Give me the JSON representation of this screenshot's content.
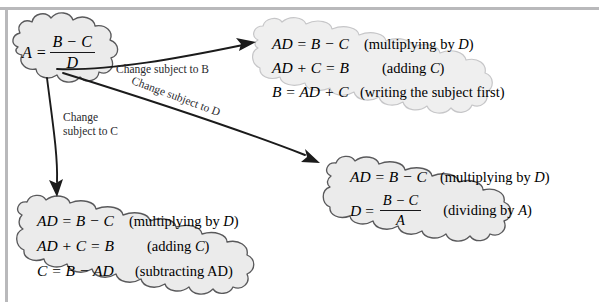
{
  "diagram": {
    "colors": {
      "cloud_fill": "#ebebeb",
      "cloud_stroke": "#59595b",
      "pale_cloud_fill": "#efefef",
      "pale_cloud_stroke": "#c6c6c8",
      "arrow": "#1b1b1b",
      "page_rule": "#b9b9bb",
      "text": "#17171a"
    },
    "source": {
      "lhs": "A",
      "equals": "=",
      "numerator": "B − C",
      "denominator": "D",
      "full": "A = (B − C) / D"
    },
    "arrows": [
      {
        "id": "to-b",
        "label": "Change subject to B",
        "rotated": false,
        "target": "result-b"
      },
      {
        "id": "to-d",
        "label": "Change subject to D",
        "rotated": true,
        "target": "result-d"
      },
      {
        "id": "to-c",
        "label_line1": "Change",
        "label_line2": "subject to C",
        "rotated": false,
        "target": "result-c"
      }
    ],
    "results": [
      {
        "id": "result-b",
        "style": "pale",
        "rows": [
          {
            "lhs": "AD = B − C",
            "rhs_prefix": "(multiplying by ",
            "rhs_italic": "D",
            "rhs_suffix": ")"
          },
          {
            "lhs": "AD + C = B",
            "rhs_prefix": "(adding ",
            "rhs_italic": "C",
            "rhs_suffix": ")"
          },
          {
            "lhs": "B = AD + C",
            "rhs_prefix": "(writing the subject first)",
            "rhs_italic": "",
            "rhs_suffix": ""
          }
        ]
      },
      {
        "id": "result-d",
        "style": "normal",
        "rows": [
          {
            "lhs": "AD = B − C",
            "rhs_prefix": "(multiplying by ",
            "rhs_italic": "D",
            "rhs_suffix": ")"
          },
          {
            "lhs_fraction": {
              "left": "D",
              "equals": "=",
              "numerator": "B − C",
              "denominator": "A"
            },
            "rhs_prefix": "(dividing by ",
            "rhs_italic": "A",
            "rhs_suffix": ")"
          }
        ]
      },
      {
        "id": "result-c",
        "style": "normal",
        "rows": [
          {
            "lhs": "AD = B − C",
            "rhs_prefix": "(multiplying by ",
            "rhs_italic": "D",
            "rhs_suffix": ")"
          },
          {
            "lhs": "AD + C = B",
            "rhs_prefix": "(adding ",
            "rhs_italic": "C",
            "rhs_suffix": ")"
          },
          {
            "lhs": "C = B − AD",
            "rhs_prefix": "(subtracting AD)",
            "rhs_italic": "",
            "rhs_suffix": ""
          }
        ]
      }
    ]
  }
}
